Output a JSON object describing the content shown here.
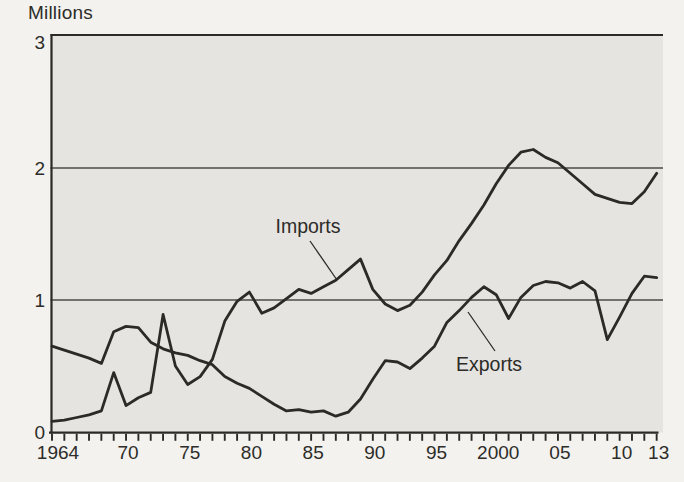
{
  "figure": {
    "y_axis_unit_label": "Millions"
  },
  "chart_data": {
    "type": "line",
    "title": "",
    "xlabel": "",
    "ylabel": "Millions",
    "ylim": [
      0,
      3
    ],
    "y_ticks": [
      0,
      1,
      2,
      3
    ],
    "grid_y_values": [
      1,
      2
    ],
    "grid": "horizontal-only",
    "x_range": [
      1964,
      2013
    ],
    "x_tick_every_year": true,
    "x_tick_labels": [
      {
        "year": 1964,
        "text": "1964"
      },
      {
        "year": 1970,
        "text": "70"
      },
      {
        "year": 1975,
        "text": "75"
      },
      {
        "year": 1980,
        "text": "80"
      },
      {
        "year": 1985,
        "text": "85"
      },
      {
        "year": 1990,
        "text": "90"
      },
      {
        "year": 1995,
        "text": "95"
      },
      {
        "year": 2000,
        "text": "2000"
      },
      {
        "year": 2005,
        "text": "05"
      },
      {
        "year": 2010,
        "text": "10"
      },
      {
        "year": 2013,
        "text": "13"
      }
    ],
    "x": [
      1964,
      1965,
      1966,
      1967,
      1968,
      1969,
      1970,
      1971,
      1972,
      1973,
      1974,
      1975,
      1976,
      1977,
      1978,
      1979,
      1980,
      1981,
      1982,
      1983,
      1984,
      1985,
      1986,
      1987,
      1988,
      1989,
      1990,
      1991,
      1992,
      1993,
      1994,
      1995,
      1996,
      1997,
      1998,
      1999,
      2000,
      2001,
      2002,
      2003,
      2004,
      2005,
      2006,
      2007,
      2008,
      2009,
      2010,
      2011,
      2012,
      2013
    ],
    "series": [
      {
        "name": "Imports",
        "values": [
          0.08,
          0.09,
          0.11,
          0.13,
          0.16,
          0.45,
          0.2,
          0.26,
          0.3,
          0.89,
          0.5,
          0.36,
          0.42,
          0.55,
          0.84,
          0.99,
          1.06,
          0.9,
          0.94,
          1.01,
          1.08,
          1.05,
          1.1,
          1.15,
          1.23,
          1.31,
          1.08,
          0.97,
          0.92,
          0.96,
          1.06,
          1.19,
          1.3,
          1.45,
          1.58,
          1.72,
          1.88,
          2.02,
          2.12,
          2.14,
          2.08,
          2.04,
          1.96,
          1.88,
          1.8,
          1.77,
          1.74,
          1.73,
          1.82,
          1.96
        ]
      },
      {
        "name": "Exports",
        "values": [
          0.65,
          0.62,
          0.59,
          0.56,
          0.52,
          0.76,
          0.8,
          0.79,
          0.68,
          0.63,
          0.6,
          0.58,
          0.54,
          0.51,
          0.42,
          0.37,
          0.33,
          0.27,
          0.21,
          0.16,
          0.17,
          0.15,
          0.16,
          0.12,
          0.15,
          0.25,
          0.4,
          0.54,
          0.53,
          0.48,
          0.56,
          0.65,
          0.83,
          0.92,
          1.02,
          1.1,
          1.04,
          0.86,
          1.02,
          1.11,
          1.14,
          1.13,
          1.09,
          1.14,
          1.07,
          0.7,
          0.87,
          1.05,
          1.18,
          1.17
        ]
      }
    ],
    "legend": "inline-annotations",
    "annotations": [
      {
        "series_index": 0,
        "text_x": 308,
        "text_y": 233,
        "leader": [
          310,
          241,
          337,
          280
        ]
      },
      {
        "series_index": 1,
        "text_x": 489,
        "text_y": 371,
        "leader": [
          495,
          351,
          468,
          312
        ]
      }
    ],
    "colors": {
      "line": "#2b2a27",
      "grid": "#4d4b47",
      "plot_bg": "#e5e4e1",
      "page_bg": "#f3f2ef",
      "text": "#2d2c29"
    }
  }
}
